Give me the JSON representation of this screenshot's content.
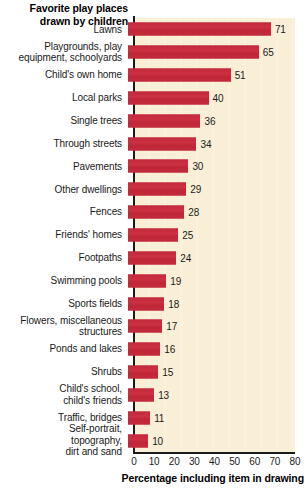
{
  "chart_data": {
    "type": "bar",
    "orientation": "horizontal",
    "title": "Favorite play places\ndrawn by children",
    "xlabel": "Percentage including item in drawing",
    "ylabel": "",
    "xlim": [
      0,
      80
    ],
    "xticks": [
      0,
      10,
      20,
      30,
      40,
      50,
      60,
      70,
      80
    ],
    "grid": false,
    "legend": null,
    "bar_color": "#c32a3c",
    "plot_background": "#f9efd6",
    "categories": [
      "Lawns",
      "Playgrounds, play\nequipment, schoolyards",
      "Child's own home",
      "Local parks",
      "Single trees",
      "Through streets",
      "Pavements",
      "Other dwellings",
      "Fences",
      "Friends' homes",
      "Footpaths",
      "Swimming pools",
      "Sports fields",
      "Flowers, miscellaneous\nstructures",
      "Ponds and lakes",
      "Shrubs",
      "Child's school,\nchild's friends",
      "Traffic, bridges",
      "Self-portrait,\ntopography,\ndirt and sand"
    ],
    "values": [
      71,
      65,
      51,
      40,
      36,
      34,
      30,
      29,
      28,
      25,
      24,
      19,
      18,
      17,
      16,
      15,
      13,
      11,
      10
    ],
    "value_labels": [
      "71",
      "65",
      "51",
      "40",
      "36",
      "34",
      "30",
      "29",
      "28",
      "25",
      "24",
      "19",
      "18",
      "17",
      "16",
      "15",
      "13",
      "11",
      "10"
    ]
  }
}
